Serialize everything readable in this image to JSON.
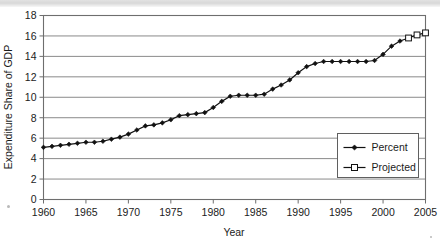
{
  "figure": {
    "background_color": "#ffffff",
    "ink_color": "#111111",
    "grid_color": "#8a8a8a",
    "frame_color": "#6e6e6e",
    "scan_artifact_color": "#dcdcdc"
  },
  "chart_data": {
    "type": "line",
    "title": "",
    "subtitle": "",
    "xlabel": "Year",
    "ylabel": "Expenditure Share of GDP",
    "xlim": [
      1960,
      2005
    ],
    "ylim": [
      0,
      18
    ],
    "xticks": [
      1960,
      1965,
      1970,
      1975,
      1980,
      1985,
      1990,
      1995,
      2000,
      2005
    ],
    "xtick_labels": [
      "1960",
      "1965",
      "1970",
      "1975",
      "1980",
      "1985",
      "1990",
      "1995",
      "2000",
      "2005"
    ],
    "yticks": [
      0,
      2,
      4,
      6,
      8,
      10,
      12,
      14,
      16,
      18
    ],
    "ytick_labels": [
      "0",
      "2",
      "4",
      "6",
      "8",
      "10",
      "12",
      "14",
      "16",
      "18"
    ],
    "grid": "horizontal",
    "legend_position": "lower-right-inside",
    "x": [
      1960,
      1961,
      1962,
      1963,
      1964,
      1965,
      1966,
      1967,
      1968,
      1969,
      1970,
      1971,
      1972,
      1973,
      1974,
      1975,
      1976,
      1977,
      1978,
      1979,
      1980,
      1981,
      1982,
      1983,
      1984,
      1985,
      1986,
      1987,
      1988,
      1989,
      1990,
      1991,
      1992,
      1993,
      1994,
      1995,
      1996,
      1997,
      1998,
      1999,
      2000,
      2001,
      2002,
      2003,
      2004,
      2005
    ],
    "series": [
      {
        "name": "Percent",
        "marker": "filled-diamond",
        "marker_color": "#111111",
        "line_color": "#111111",
        "x": [
          1960,
          1961,
          1962,
          1963,
          1964,
          1965,
          1966,
          1967,
          1968,
          1969,
          1970,
          1971,
          1972,
          1973,
          1974,
          1975,
          1976,
          1977,
          1978,
          1979,
          1980,
          1981,
          1982,
          1983,
          1984,
          1985,
          1986,
          1987,
          1988,
          1989,
          1990,
          1991,
          1992,
          1993,
          1994,
          1995,
          1996,
          1997,
          1998,
          1999,
          2000,
          2001,
          2002
        ],
        "values": [
          5.1,
          5.2,
          5.3,
          5.4,
          5.5,
          5.6,
          5.6,
          5.7,
          5.9,
          6.1,
          6.4,
          6.8,
          7.2,
          7.3,
          7.5,
          7.8,
          8.2,
          8.3,
          8.4,
          8.5,
          9.0,
          9.6,
          10.1,
          10.2,
          10.2,
          10.2,
          10.3,
          10.8,
          11.2,
          11.7,
          12.4,
          13.0,
          13.3,
          13.5,
          13.5,
          13.5,
          13.5,
          13.5,
          13.5,
          13.6,
          14.2,
          15.0,
          15.5
        ]
      },
      {
        "name": "Projected",
        "marker": "open-square",
        "marker_color": "#ffffff",
        "line_color": "#111111",
        "x": [
          2002,
          2003,
          2004,
          2005
        ],
        "values": [
          15.5,
          15.8,
          16.1,
          16.3
        ]
      }
    ],
    "legend_entries": [
      {
        "label": "Percent",
        "marker": "filled-diamond"
      },
      {
        "label": "Projected",
        "marker": "open-square"
      }
    ]
  }
}
